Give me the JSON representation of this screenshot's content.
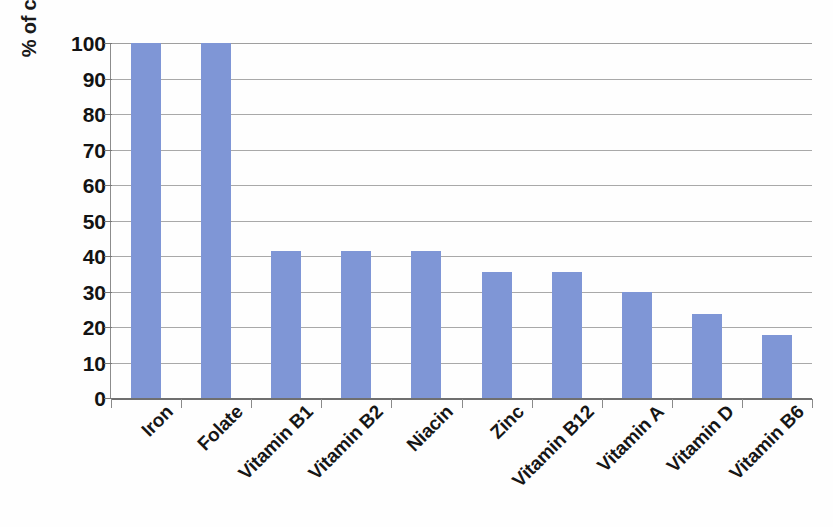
{
  "chart_data": {
    "type": "bar",
    "title": "",
    "subtitle": "",
    "xlabel": "",
    "ylabel": "% of countries adding micronutrient",
    "categories": [
      "Iron",
      "Folate",
      "Vitamin B1",
      "Vitamin B2",
      "Niacin",
      "Zinc",
      "Vitamin B12",
      "Vitamin A",
      "Vitamin D",
      "Vitamin B6"
    ],
    "values": [
      100,
      100,
      41.4,
      41.4,
      41.4,
      35.6,
      35.6,
      30,
      23.6,
      17.7
    ],
    "ylim": [
      0,
      100
    ],
    "ytick_labels": [
      "100",
      "90",
      "80",
      "70",
      "60",
      "50",
      "40",
      "30",
      "20",
      "10",
      "0"
    ],
    "ytick_values": [
      100,
      90,
      80,
      70,
      60,
      50,
      40,
      30,
      20,
      10,
      0
    ],
    "grid": true,
    "legend": "none",
    "series": [
      {
        "name": "% of countries adding micronutrient",
        "color": "#7f96d6",
        "values": [
          100,
          100,
          41.4,
          41.4,
          41.4,
          35.6,
          35.6,
          30,
          23.6,
          17.7
        ]
      }
    ]
  },
  "colors": {
    "bar": "#7f96d6",
    "gridline": "#9a9a9a",
    "axis": "#6f6f6f",
    "text": "#161616",
    "background": "#fefefe"
  }
}
